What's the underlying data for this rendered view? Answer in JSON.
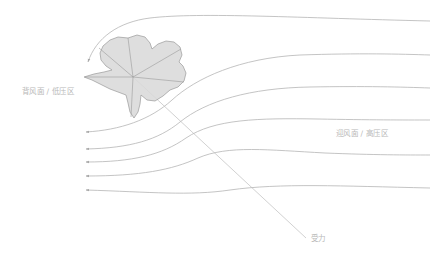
{
  "diagram": {
    "kind": "airflow-streamline-diagram",
    "background_color": "#ffffff",
    "annotations": {
      "leeward": "背风面 / 低压区",
      "windward": "迎风面 / 高压区",
      "force": "受力"
    },
    "colors": {
      "body_fill": "#d8d8d8",
      "body_stroke": "#9a9a9a",
      "streamline": "#b0b0b0",
      "leader_line": "#bdbdbd",
      "label_text": "#b9b9b9",
      "arrowhead": "#a8a8a8"
    },
    "body": {
      "name": "obstacle-body",
      "center": [
        133,
        77
      ],
      "outline_points": "128,38 137,35 145,37 150,43 152,49 158,44 166,41 174,42 180,47 182,55 179,62 183,66 186,73 184,81 178,87 170,90 163,96 155,101 147,100 141,95 140,104 138,112 134,118 130,112 128,103 126,95 118,92 110,89 100,84 92,80 84,77 94,74 104,72 112,70 106,66 101,60 100,53 103,46 110,40 118,37",
      "spoke_count": 6,
      "spokes": [
        [
          133,
          77,
          99,
          48
        ],
        [
          133,
          77,
          128,
          38
        ],
        [
          133,
          77,
          181,
          49
        ],
        [
          133,
          77,
          184,
          82
        ],
        [
          133,
          77,
          131,
          117
        ],
        [
          133,
          77,
          85,
          77
        ]
      ]
    },
    "streamlines": {
      "count": 6,
      "note": "Flow moves left to right, deflecting around the obstacle and flattening downstream at the right edge.",
      "right_edge_y": [
        22,
        55,
        88,
        120,
        155,
        188
      ],
      "paths": [
        "M 88,62 C 96,38 118,22 150,18 C 200,12 300,18 430,21",
        "M 86,132 C 120,130 150,120 172,100 C 196,78 240,58 300,55 C 360,53 400,54 430,55",
        "M 86,149 C 130,148 158,140 180,122 C 206,101 250,88 310,87 C 365,86 402,87 430,88",
        "M 86,162 C 132,162 162,155 186,138 C 214,119 258,118 318,119 C 370,120 404,120 430,120",
        "M 86,176 C 140,176 172,170 198,158 C 228,145 268,150 325,153 C 375,155 406,155 430,155",
        "M 86,190 C 150,192 190,196 230,190 C 280,183 340,186 430,188"
      ],
      "arrow_tips": [
        [
          88,
          62
        ],
        [
          86,
          132
        ],
        [
          86,
          149
        ],
        [
          86,
          162
        ],
        [
          86,
          176
        ],
        [
          86,
          190
        ]
      ]
    },
    "leader_line": {
      "name": "force-leader-line",
      "from": [
        133,
        77
      ],
      "to": [
        306,
        238
      ]
    }
  }
}
